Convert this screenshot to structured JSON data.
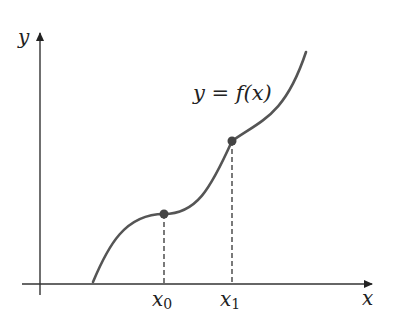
{
  "diagram": {
    "axes": {
      "x_label": "x",
      "y_label": "y"
    },
    "curve_label": "y = f(x)",
    "points": [
      {
        "name": "x0",
        "label_base": "x",
        "label_sub": "0"
      },
      {
        "name": "x1",
        "label_base": "x",
        "label_sub": "1"
      }
    ],
    "colors": {
      "curve": "#555555",
      "axis": "#333333",
      "point": "#444444"
    }
  }
}
